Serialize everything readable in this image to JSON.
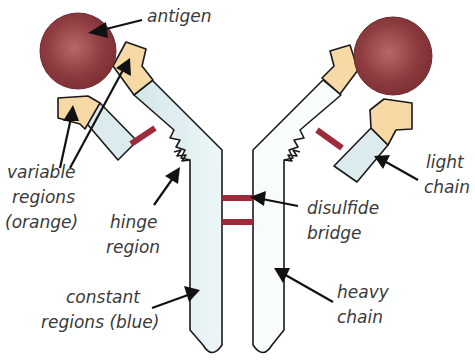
{
  "diagram": {
    "labels": {
      "antigen": "antigen",
      "variable_regions": [
        "variable",
        "regions",
        "(orange)"
      ],
      "hinge_region": [
        "hinge",
        "region"
      ],
      "constant_regions": [
        "constant",
        "regions (blue)"
      ],
      "light_chain": [
        "light",
        "chain"
      ],
      "disulfide_bridge": [
        "disulfide",
        "bridge"
      ],
      "heavy_chain": [
        "heavy",
        "chain"
      ]
    },
    "components": [
      {
        "name": "antigen",
        "count": 2,
        "shape": "circle"
      },
      {
        "name": "heavy chain",
        "count": 2,
        "shape": "Y-arm polygon"
      },
      {
        "name": "light chain",
        "count": 2,
        "shape": "rectangle"
      },
      {
        "name": "variable region",
        "count": 4,
        "shape": "pentagon"
      },
      {
        "name": "disulfide bridge",
        "count": 4,
        "shape": "bar"
      },
      {
        "name": "hinge",
        "count": 2,
        "shape": "zigzag"
      }
    ],
    "colors": {
      "antigen": "#8b3a3e",
      "antigen_highlight": "#b7686a",
      "variable_region": "#f7d9a6",
      "constant_region": "#dcebee",
      "disulfide_bridge": "#9e2b3c",
      "outline": "#1a1a1a",
      "text": "#3a3a3a",
      "background": "#ffffff"
    }
  }
}
